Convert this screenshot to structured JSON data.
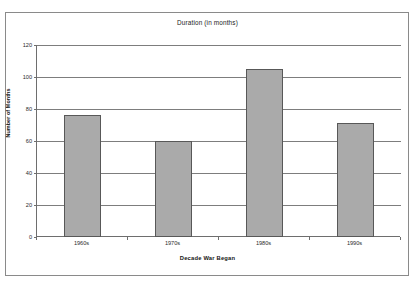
{
  "chart_data": {
    "type": "bar",
    "title": "Duration (in months)",
    "xlabel": "Decade War Began",
    "ylabel": "Number of Months",
    "categories": [
      "1960s",
      "1970s",
      "1980s",
      "1990s"
    ],
    "values": [
      76,
      60,
      105,
      71
    ],
    "ylim": [
      0,
      120
    ],
    "yticks": [
      0,
      20,
      40,
      60,
      80,
      100,
      120
    ],
    "ytick_labels": [
      "0",
      "20",
      "40",
      "60",
      "80",
      "100",
      "120"
    ],
    "grid": true,
    "legend": "none",
    "series": [
      {
        "name": "Duration (in months)",
        "values": [
          76,
          60,
          105,
          71
        ]
      }
    ],
    "colors": {
      "bar_fill": "#aaaaaa",
      "bar_edge": "#585858",
      "gridline": "#7d7d7d",
      "axis": "#6e6e6e",
      "frame": "#8a8a8a",
      "background": "#ffffff",
      "text": "#1b1b1b"
    }
  }
}
